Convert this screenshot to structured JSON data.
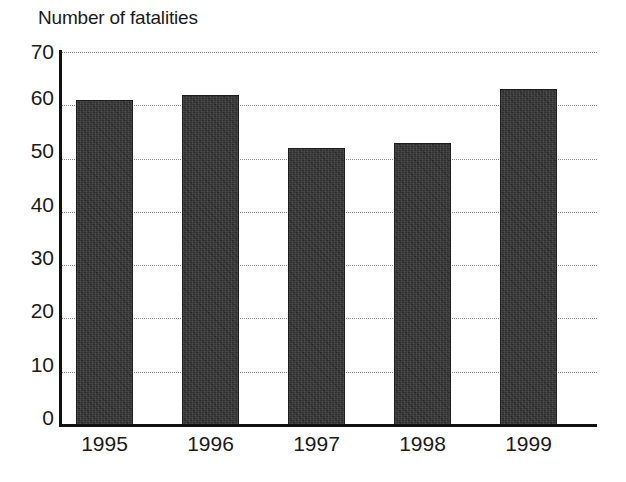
{
  "chart_data": {
    "type": "bar",
    "title": "Number of fatalities",
    "xlabel": "",
    "ylabel": "",
    "categories": [
      "1995",
      "1996",
      "1997",
      "1998",
      "1999"
    ],
    "values": [
      61,
      62,
      52,
      53,
      63
    ],
    "ylim": [
      0,
      70
    ],
    "yticks": [
      0,
      10,
      20,
      30,
      40,
      50,
      60,
      70
    ],
    "ytick_labels": [
      "0",
      "10",
      "20",
      "30",
      "40",
      "50",
      "60",
      "70"
    ],
    "grid": true,
    "grid_axis": "y",
    "grid_style": "dotted",
    "legend": false,
    "legend_position": "none",
    "bar_color": "#333333",
    "axis_color": "#111111",
    "grid_color": "#8d8d8d",
    "background_color": "#ffffff"
  },
  "figure": {
    "title": "Number of fatalities"
  }
}
